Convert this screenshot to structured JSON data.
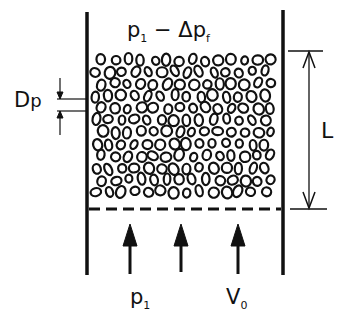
{
  "diagram": {
    "type": "packed-bed-schematic",
    "labels": {
      "top_pressure": {
        "main": "p",
        "sub": "1",
        "rest": " − Δp",
        "rest_sub": "f"
      },
      "particle_diameter": {
        "main": "D",
        "sub": "p"
      },
      "bed_length": "L",
      "inlet_pressure": {
        "main": "p",
        "sub": "1"
      },
      "superficial_velocity": {
        "main": "V",
        "sub": "0"
      }
    },
    "elements": [
      "container-walls",
      "packed-particles",
      "distributor-plate",
      "flow-arrows",
      "dimension-L",
      "dimension-Dp"
    ],
    "colors": {
      "ink": "#111111",
      "background": "#ffffff"
    }
  }
}
